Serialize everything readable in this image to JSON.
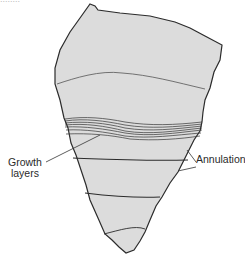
{
  "figure": {
    "top_fragment_text": "........",
    "fill_color": "#dcdcdc",
    "outline_color": "#2b2b2b",
    "labels": {
      "growth_layers_line1": "Growth",
      "growth_layers_line2": "layers",
      "annulation": "Annulation"
    }
  }
}
